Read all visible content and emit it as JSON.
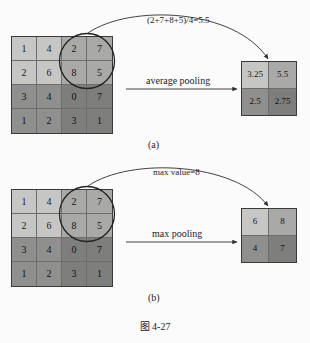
{
  "figure": {
    "caption": "图 4-27",
    "panels": [
      {
        "id": "a",
        "sublabel": "(a)",
        "operation_label": "average pooling",
        "annotation": "(2+7+8+5)/4=5.5",
        "input": {
          "rows": [
            [
              "1",
              "4",
              "2",
              "7"
            ],
            [
              "2",
              "6",
              "8",
              "5"
            ],
            [
              "3",
              "4",
              "0",
              "7"
            ],
            [
              "1",
              "2",
              "3",
              "1"
            ]
          ]
        },
        "output": {
          "rows": [
            [
              "3.25",
              "5.5"
            ],
            [
              "2.5",
              "2.75"
            ]
          ]
        }
      },
      {
        "id": "b",
        "sublabel": "(b)",
        "operation_label": "max pooling",
        "annotation": "max value=8",
        "input": {
          "rows": [
            [
              "1",
              "4",
              "2",
              "7"
            ],
            [
              "2",
              "6",
              "8",
              "5"
            ],
            [
              "3",
              "4",
              "0",
              "7"
            ],
            [
              "1",
              "2",
              "3",
              "1"
            ]
          ]
        },
        "output": {
          "rows": [
            [
              "6",
              "8"
            ],
            [
              "4",
              "7"
            ]
          ]
        }
      }
    ],
    "colors": {
      "quadrant_top_left": "#c6c6c4",
      "quadrant_top_right": "#a9a9a7",
      "quadrant_bottom_left": "#8f8f8d",
      "quadrant_bottom_right": "#7e7e7c",
      "grid_border": "#3a3a3a",
      "cell_divider": "#6d6d6d",
      "page_background": "#fbfbfb",
      "ink": "#1b1b1b"
    }
  }
}
